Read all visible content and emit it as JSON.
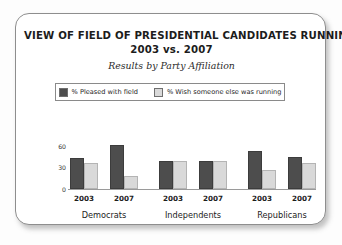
{
  "card": {
    "title_lines": [
      "VIEW OF FIELD OF PRESIDENTIAL CANDIDATES RUNNING,",
      "2003 vs. 2007"
    ],
    "subtitle": "Results by Party Affiliation"
  },
  "legend": {
    "items": [
      {
        "label": "% Pleased with field",
        "color": "#4d4d4d"
      },
      {
        "label": "% Wish someone else was running",
        "color": "#d9d9d9"
      }
    ]
  },
  "chart_data": {
    "type": "bar",
    "title": "VIEW OF FIELD OF PRESIDENTIAL CANDIDATES RUNNING, 2003 vs. 2007",
    "subtitle": "Results by Party Affiliation",
    "xlabel": "",
    "ylabel": "",
    "ylim": [
      0,
      75
    ],
    "yticks": [
      "0",
      "30",
      "60"
    ],
    "grid": false,
    "legend_position": "top",
    "groups": [
      "Democrats",
      "Independents",
      "Republicans"
    ],
    "categories": [
      "2003",
      "2007",
      "2003",
      "2007",
      "2003",
      "2007"
    ],
    "series": [
      {
        "name": "% Pleased with field",
        "color": "#4d4d4d",
        "values": [
          50,
          70,
          44,
          45,
          61,
          51
        ]
      },
      {
        "name": "% Wish someone else was running",
        "color": "#d9d9d9",
        "values": [
          41,
          21,
          44,
          44,
          30,
          41
        ]
      }
    ]
  },
  "axis": {
    "ticks": [
      {
        "label": "60",
        "value": 60
      },
      {
        "label": "30",
        "value": 30
      },
      {
        "label": "0",
        "value": 0
      }
    ]
  },
  "xaxis": {
    "groups": [
      {
        "party": "Democrats",
        "years": [
          "2003",
          "2007"
        ]
      },
      {
        "party": "Independents",
        "years": [
          "2003",
          "2007"
        ]
      },
      {
        "party": "Republicans",
        "years": [
          "2003",
          "2007"
        ]
      }
    ]
  }
}
